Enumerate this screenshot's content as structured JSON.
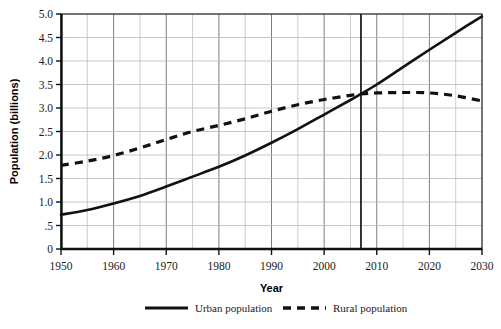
{
  "chart_data": {
    "type": "line",
    "title": "",
    "xlabel": "Year",
    "ylabel": "Population (billions)",
    "xlim": [
      1950,
      2030
    ],
    "ylim": [
      0,
      5.0
    ],
    "grid": true,
    "legend_position": "bottom",
    "x_ticks": [
      "1950",
      "1960",
      "1970",
      "1980",
      "1990",
      "2000",
      "2010",
      "2020",
      "2030"
    ],
    "x_tick_values": [
      1950,
      1960,
      1970,
      1980,
      1990,
      2000,
      2010,
      2020,
      2030
    ],
    "x_minor_step": 5,
    "y_ticks": [
      "0",
      ".5",
      "1.0",
      "1.5",
      "2.0",
      "2.5",
      "3.0",
      "3.5",
      "4.0",
      "4.5",
      "5.0"
    ],
    "y_tick_values": [
      0,
      0.5,
      1.0,
      1.5,
      2.0,
      2.5,
      3.0,
      3.5,
      4.0,
      4.5,
      5.0
    ],
    "x": [
      1950,
      1955,
      1960,
      1965,
      1970,
      1975,
      1980,
      1985,
      1990,
      1995,
      2000,
      2005,
      2007,
      2010,
      2015,
      2020,
      2025,
      2030
    ],
    "series": [
      {
        "name": "Urban population",
        "style": "solid",
        "color": "#111111",
        "values": [
          0.73,
          0.83,
          0.97,
          1.13,
          1.33,
          1.54,
          1.75,
          1.99,
          2.26,
          2.55,
          2.86,
          3.17,
          3.3,
          3.5,
          3.87,
          4.24,
          4.6,
          4.95
        ]
      },
      {
        "name": "Rural population",
        "style": "dashed",
        "color": "#111111",
        "values": [
          1.78,
          1.87,
          1.99,
          2.15,
          2.33,
          2.5,
          2.63,
          2.77,
          2.93,
          3.07,
          3.18,
          3.27,
          3.3,
          3.32,
          3.33,
          3.32,
          3.26,
          3.15
        ]
      }
    ],
    "annotations": [
      {
        "type": "vertical-line",
        "name": "crossover-marker",
        "x_value": 2007,
        "label": ""
      }
    ]
  },
  "legend": {
    "items": [
      {
        "label": "Urban population",
        "style": "solid"
      },
      {
        "label": "Rural population",
        "style": "dashed"
      }
    ]
  }
}
